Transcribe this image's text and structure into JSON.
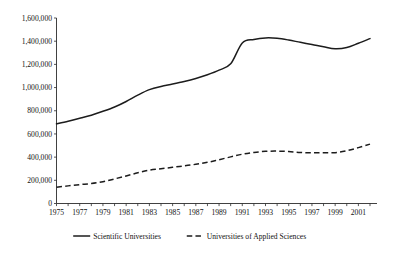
{
  "chart_data": {
    "type": "line",
    "title": "",
    "xlabel": "",
    "ylabel": "",
    "grid": false,
    "legend_position": "bottom",
    "xlim": [
      1975,
      2002
    ],
    "ylim": [
      0,
      1600000
    ],
    "x": [
      1975,
      1976,
      1977,
      1978,
      1979,
      1980,
      1981,
      1982,
      1983,
      1984,
      1985,
      1986,
      1987,
      1988,
      1989,
      1990,
      1991,
      1992,
      1993,
      1994,
      1995,
      1996,
      1997,
      1998,
      1999,
      2000,
      2001,
      2002
    ],
    "x_tick_labels": [
      "1975",
      "1977",
      "1979",
      "1981",
      "1983",
      "1985",
      "1987",
      "1989",
      "1991",
      "1993",
      "1995",
      "1997",
      "1999",
      "2001"
    ],
    "y_tick_labels": [
      "0",
      "200,000",
      "400,000",
      "600,000",
      "800,000",
      "1,000,000",
      "1,200,000",
      "1,400,000",
      "1,600,000"
    ],
    "y_tick_values": [
      0,
      200000,
      400000,
      600000,
      800000,
      1000000,
      1200000,
      1400000,
      1600000
    ],
    "series": [
      {
        "name": "Scientific Universities",
        "style": "solid",
        "color": "#1c1c1c",
        "values": [
          688000,
          710000,
          735000,
          762000,
          795000,
          832000,
          880000,
          935000,
          982000,
          1010000,
          1030000,
          1052000,
          1078000,
          1110000,
          1150000,
          1205000,
          1385000,
          1415000,
          1428000,
          1425000,
          1410000,
          1390000,
          1372000,
          1352000,
          1335000,
          1345000,
          1382000,
          1422000
        ]
      },
      {
        "name": "Universities of Applied Sciences",
        "style": "dashed",
        "color": "#1c1c1c",
        "values": [
          140000,
          152000,
          163000,
          172000,
          188000,
          212000,
          238000,
          265000,
          288000,
          300000,
          312000,
          325000,
          338000,
          355000,
          378000,
          402000,
          425000,
          440000,
          450000,
          452000,
          448000,
          440000,
          437000,
          438000,
          438000,
          455000,
          482000,
          512000
        ]
      }
    ]
  },
  "legend": {
    "items": [
      {
        "label": "Scientific Universities",
        "style": "solid"
      },
      {
        "label": "Universities of Applied Sciences",
        "style": "dashed"
      }
    ]
  }
}
